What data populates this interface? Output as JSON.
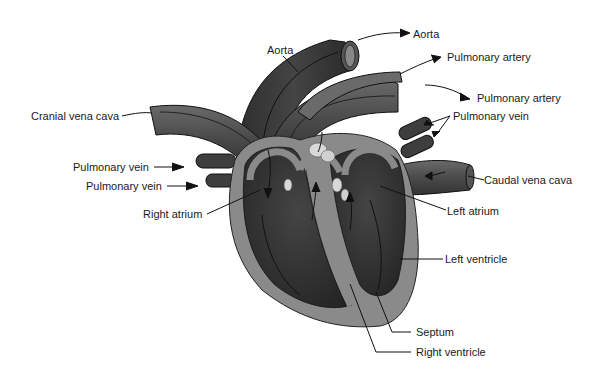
{
  "diagram": {
    "labels": {
      "aorta_top": "Aorta",
      "aorta_left": "Aorta",
      "pulmonary_artery_1": "Pulmonary artery",
      "pulmonary_artery_2": "Pulmonary artery",
      "pulmonary_vein_right": "Pulmonary vein",
      "cranial_vena_cava": "Cranial vena cava",
      "pulmonary_vein_left_1": "Pulmonary vein",
      "pulmonary_vein_left_2": "Pulmonary vein",
      "caudal_vena_cava": "Caudal vena cava",
      "right_atrium": "Right atrium",
      "left_atrium": "Left atrium",
      "left_ventricle": "Left ventricle",
      "septum": "Septum",
      "right_ventricle": "Right ventricle"
    },
    "colors": {
      "dark_chamber": "#2f2f2f",
      "vessel_dark": "#3a3a3a",
      "vessel_mid": "#5a5a5a",
      "wall_light": "#8a8a8a",
      "valve": "#d8d8d8",
      "line": "#111111"
    }
  }
}
